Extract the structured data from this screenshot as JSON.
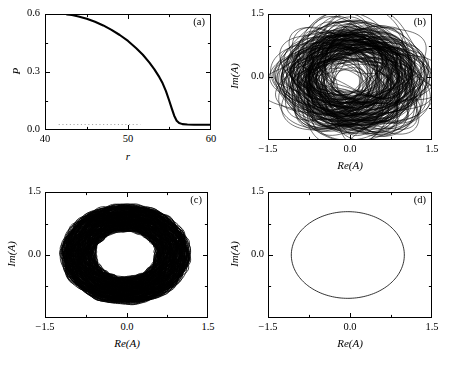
{
  "figure": {
    "background": "#ffffff",
    "ink": "#000000",
    "width": 449,
    "height": 381
  },
  "chart_data": [
    {
      "id": "a",
      "type": "line",
      "panel_label": "(a)",
      "title": "",
      "xlabel": "r",
      "ylabel": "P",
      "xlim": [
        40,
        60
      ],
      "ylim": [
        0.0,
        0.6
      ],
      "xticks": [
        40,
        50,
        60
      ],
      "xticklabels": [
        "40",
        "50",
        "60"
      ],
      "yticks": [
        0.0,
        0.3,
        0.6
      ],
      "yticklabels": [
        "0.0",
        "0.3",
        "0.6"
      ],
      "xminorticks": [
        45,
        55
      ],
      "yminorticks": [
        0.15,
        0.45
      ],
      "grid": false,
      "legend": null,
      "series": [
        {
          "name": "P(r)",
          "style": "solid-thick",
          "x": [
            42.6,
            43.2,
            44.0,
            45.0,
            46.0,
            47.0,
            48.0,
            49.0,
            50.0,
            51.0,
            51.8,
            52.6,
            53.2,
            53.8,
            54.2,
            54.6,
            55.0,
            55.3,
            55.6,
            55.9,
            56.2,
            56.6,
            57.2,
            58.0,
            59.0,
            60.0
          ],
          "y": [
            0.6,
            0.597,
            0.59,
            0.578,
            0.562,
            0.543,
            0.52,
            0.493,
            0.462,
            0.424,
            0.39,
            0.349,
            0.314,
            0.273,
            0.241,
            0.2,
            0.15,
            0.11,
            0.072,
            0.046,
            0.034,
            0.028,
            0.026,
            0.025,
            0.025,
            0.025
          ]
        }
      ],
      "reference_line": {
        "name": "baseline",
        "style": "dotted",
        "y": 0.026,
        "x_start": 41.6,
        "x_end": 51.5,
        "color": "#9a9a9a"
      }
    },
    {
      "id": "b",
      "type": "line",
      "panel_label": "(b)",
      "title": "",
      "xlabel": "Re(A)",
      "ylabel": "Im(A)",
      "xlim": [
        -1.5,
        1.5
      ],
      "ylim": [
        -1.5,
        1.5
      ],
      "xticks": [
        -1.5,
        0.0,
        1.5
      ],
      "xticklabels": [
        "−1.5",
        "0.0",
        "1.5"
      ],
      "yticks": [
        -1.5,
        0.0,
        1.5
      ],
      "yticklabels": [
        "",
        "0.0",
        "1.5"
      ],
      "xminorticks": [
        -0.75,
        0.75
      ],
      "yminorticks": [
        -0.75,
        0.75
      ],
      "grid": false,
      "legend": null,
      "description": "chaotic attractor: dense tangle of wandering loops filling a disk",
      "attractor": {
        "mode": "chaotic-loops",
        "center": [
          0.02,
          -0.03
        ],
        "radius_mean": 0.92,
        "radius_spread": 0.34,
        "loop_count": 170,
        "drift": 0.3,
        "linewidth": 0.55
      }
    },
    {
      "id": "c",
      "type": "line",
      "panel_label": "(c)",
      "title": "",
      "xlabel": "Re(A)",
      "ylabel": "Im(A)",
      "xlim": [
        -1.5,
        1.5
      ],
      "ylim": [
        -1.5,
        1.5
      ],
      "xticks": [
        -1.5,
        0.0,
        1.5
      ],
      "xticklabels": [
        "−1.5",
        "0.0",
        "1.5"
      ],
      "yticks": [
        -1.5,
        0.0,
        1.5
      ],
      "yticklabels": [
        "",
        "0.0",
        "1.5"
      ],
      "xminorticks": [
        -0.75,
        0.75
      ],
      "yminorticks": [
        -0.75,
        0.75
      ],
      "grid": false,
      "legend": null,
      "description": "quasiperiodic torus: dense filled annulus",
      "attractor": {
        "mode": "annulus",
        "center": [
          -0.02,
          0.02
        ],
        "inner_radius": 0.57,
        "outer_radius": 1.17,
        "loop_count": 240,
        "modulation": 0.045,
        "linewidth": 0.8
      }
    },
    {
      "id": "d",
      "type": "line",
      "panel_label": "(d)",
      "title": "",
      "xlabel": "Re(A)",
      "ylabel": "Im(A)",
      "xlim": [
        -1.5,
        1.5
      ],
      "ylim": [
        -1.5,
        1.5
      ],
      "xticks": [
        -1.5,
        0.0,
        1.5
      ],
      "xticklabels": [
        "−1.5",
        "0.0",
        "1.5"
      ],
      "yticks": [
        -1.5,
        0.0,
        1.5
      ],
      "yticklabels": [
        "",
        "0.0",
        "1.5"
      ],
      "xminorticks": [
        -0.75,
        0.75
      ],
      "yminorticks": [
        -0.75,
        0.75
      ],
      "grid": false,
      "legend": null,
      "description": "periodic limit cycle: single closed circle",
      "attractor": {
        "mode": "circle",
        "center": [
          -0.04,
          0.0
        ],
        "radius": 1.04,
        "loop_count": 1,
        "linewidth": 0.8
      }
    }
  ]
}
